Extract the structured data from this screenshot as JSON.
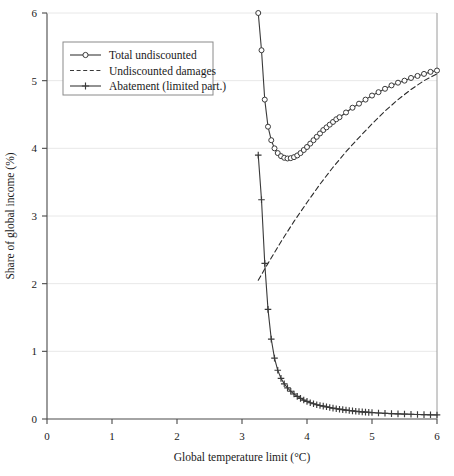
{
  "chart_data": {
    "type": "line",
    "title": "",
    "xlabel": "Global temperature limit (°C)",
    "ylabel": "Share of global income (%)",
    "xlim": [
      0,
      6
    ],
    "ylim": [
      0,
      6
    ],
    "xticks": [
      "0",
      "1",
      "2",
      "3",
      "4",
      "5",
      "6"
    ],
    "yticks": [
      "0",
      "1",
      "2",
      "3",
      "4",
      "5",
      "6"
    ],
    "grid": "horizontal-light",
    "legend_position": "top-left",
    "series": [
      {
        "name": "Total undiscounted",
        "marker": "circle-open",
        "linestyle": "solid",
        "color": "#3a3a3a",
        "x": [
          3.25,
          3.3,
          3.35,
          3.4,
          3.45,
          3.5,
          3.55,
          3.6,
          3.65,
          3.7,
          3.75,
          3.8,
          3.85,
          3.9,
          3.95,
          4.0,
          4.05,
          4.1,
          4.15,
          4.2,
          4.25,
          4.3,
          4.35,
          4.4,
          4.45,
          4.5,
          4.6,
          4.7,
          4.8,
          4.9,
          5.0,
          5.1,
          5.2,
          5.3,
          5.4,
          5.5,
          5.6,
          5.7,
          5.8,
          5.9,
          6.0
        ],
        "y": [
          6.0,
          5.45,
          4.72,
          4.32,
          4.12,
          4.0,
          3.93,
          3.885,
          3.86,
          3.85,
          3.855,
          3.87,
          3.895,
          3.93,
          3.975,
          4.02,
          4.07,
          4.12,
          4.17,
          4.22,
          4.27,
          4.31,
          4.35,
          4.39,
          4.43,
          4.46,
          4.53,
          4.6,
          4.66,
          4.72,
          4.78,
          4.83,
          4.88,
          4.93,
          4.97,
          5.0,
          5.04,
          5.07,
          5.1,
          5.13,
          5.15
        ]
      },
      {
        "name": "Undiscounted damages",
        "marker": "none",
        "linestyle": "dashed",
        "color": "#2a2a2a",
        "x": [
          3.25,
          3.4,
          3.6,
          3.8,
          4.0,
          4.2,
          4.4,
          4.6,
          4.8,
          5.0,
          5.2,
          5.4,
          5.6,
          5.8,
          6.0
        ],
        "y": [
          2.05,
          2.3,
          2.62,
          2.92,
          3.2,
          3.47,
          3.72,
          3.95,
          4.16,
          4.36,
          4.55,
          4.72,
          4.87,
          5.0,
          5.1
        ]
      },
      {
        "name": "Abatement (limited part.)",
        "marker": "plus",
        "linestyle": "solid",
        "color": "#3a3a3a",
        "x": [
          3.25,
          3.3,
          3.35,
          3.4,
          3.45,
          3.5,
          3.55,
          3.6,
          3.65,
          3.7,
          3.75,
          3.8,
          3.85,
          3.9,
          3.95,
          4.0,
          4.05,
          4.1,
          4.15,
          4.2,
          4.25,
          4.3,
          4.35,
          4.4,
          4.45,
          4.5,
          4.55,
          4.6,
          4.65,
          4.7,
          4.75,
          4.8,
          4.85,
          4.9,
          4.95,
          5.0,
          5.1,
          5.2,
          5.3,
          5.4,
          5.5,
          5.6,
          5.7,
          5.8,
          5.9,
          6.0
        ],
        "y": [
          3.9,
          3.24,
          2.3,
          1.62,
          1.18,
          0.9,
          0.72,
          0.6,
          0.52,
          0.46,
          0.41,
          0.37,
          0.335,
          0.305,
          0.28,
          0.26,
          0.24,
          0.225,
          0.21,
          0.2,
          0.19,
          0.18,
          0.17,
          0.16,
          0.152,
          0.145,
          0.138,
          0.132,
          0.126,
          0.12,
          0.115,
          0.11,
          0.106,
          0.102,
          0.098,
          0.095,
          0.089,
          0.084,
          0.08,
          0.076,
          0.073,
          0.07,
          0.067,
          0.064,
          0.062,
          0.06
        ]
      }
    ],
    "legend": [
      {
        "label": "Total undiscounted",
        "marker": "circle-open",
        "linestyle": "solid"
      },
      {
        "label": "Undiscounted damages",
        "marker": "none",
        "linestyle": "dashed"
      },
      {
        "label": "Abatement (limited part.)",
        "marker": "plus",
        "linestyle": "solid"
      }
    ]
  },
  "colors": {
    "line": "#3a3a3a",
    "axis": "#4a4a4a",
    "grid": "#e8e8e8",
    "text": "#1a1a1a",
    "background": "#ffffff"
  }
}
